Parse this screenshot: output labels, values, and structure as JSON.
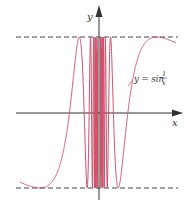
{
  "chart_data": {
    "type": "line",
    "title": "",
    "xlabel": "x",
    "ylabel": "y",
    "annotation": "y = sin 1/x",
    "series": [
      {
        "name": "y = sin(1/x)",
        "function": "sin(1/x)",
        "color": "#d0506a"
      }
    ],
    "reference_lines": [
      {
        "y": 1,
        "style": "dashed"
      },
      {
        "y": -1,
        "style": "dashed"
      }
    ],
    "xlim": [
      -0.85,
      0.85
    ],
    "ylim": [
      -1,
      1
    ],
    "grid": false,
    "legend": "none"
  },
  "labels": {
    "x_axis": "x",
    "y_axis": "y",
    "curve_eq_prefix": "y = sin ",
    "curve_eq_num": "1",
    "curve_eq_den": "x"
  },
  "colors": {
    "curve": "#d0506a",
    "axis": "#333333",
    "dash": "#444444"
  }
}
